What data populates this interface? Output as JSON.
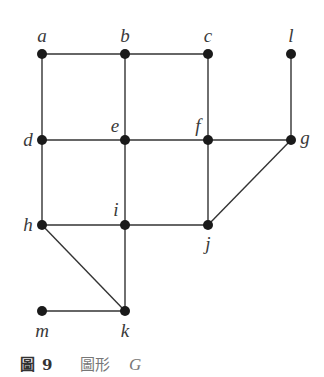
{
  "figure": {
    "caption_prefix": "圖",
    "caption_number": "9",
    "caption_title": "圖形",
    "caption_symbol": "G"
  },
  "graph": {
    "name": "G",
    "nodes": [
      {
        "id": "a",
        "label": "a",
        "x": 42,
        "y": 54,
        "lx": 42,
        "ly": 42,
        "anchor": "middle"
      },
      {
        "id": "b",
        "label": "b",
        "x": 125,
        "y": 54,
        "lx": 125,
        "ly": 42,
        "anchor": "middle"
      },
      {
        "id": "c",
        "label": "c",
        "x": 208,
        "y": 54,
        "lx": 208,
        "ly": 42,
        "anchor": "middle"
      },
      {
        "id": "l",
        "label": "l",
        "x": 291,
        "y": 54,
        "lx": 291,
        "ly": 42,
        "anchor": "middle"
      },
      {
        "id": "d",
        "label": "d",
        "x": 42,
        "y": 140,
        "lx": 28,
        "ly": 146,
        "anchor": "middle"
      },
      {
        "id": "e",
        "label": "e",
        "x": 125,
        "y": 140,
        "lx": 115,
        "ly": 132,
        "anchor": "middle"
      },
      {
        "id": "f",
        "label": "f",
        "x": 208,
        "y": 140,
        "lx": 198,
        "ly": 132,
        "anchor": "middle"
      },
      {
        "id": "g",
        "label": "g",
        "x": 291,
        "y": 140,
        "lx": 305,
        "ly": 144,
        "anchor": "middle"
      },
      {
        "id": "h",
        "label": "h",
        "x": 42,
        "y": 225,
        "lx": 28,
        "ly": 231,
        "anchor": "middle"
      },
      {
        "id": "i",
        "label": "i",
        "x": 125,
        "y": 225,
        "lx": 116,
        "ly": 216,
        "anchor": "middle"
      },
      {
        "id": "j",
        "label": "j",
        "x": 208,
        "y": 225,
        "lx": 208,
        "ly": 250,
        "anchor": "middle"
      },
      {
        "id": "m",
        "label": "m",
        "x": 42,
        "y": 311,
        "lx": 42,
        "ly": 337,
        "anchor": "middle"
      },
      {
        "id": "k",
        "label": "k",
        "x": 125,
        "y": 311,
        "lx": 125,
        "ly": 337,
        "anchor": "middle"
      }
    ],
    "edges": [
      [
        "a",
        "b"
      ],
      [
        "b",
        "c"
      ],
      [
        "a",
        "d"
      ],
      [
        "b",
        "e"
      ],
      [
        "c",
        "f"
      ],
      [
        "l",
        "g"
      ],
      [
        "d",
        "e"
      ],
      [
        "e",
        "f"
      ],
      [
        "f",
        "g"
      ],
      [
        "d",
        "h"
      ],
      [
        "e",
        "i"
      ],
      [
        "f",
        "j"
      ],
      [
        "g",
        "j"
      ],
      [
        "h",
        "i"
      ],
      [
        "i",
        "j"
      ],
      [
        "h",
        "k"
      ],
      [
        "i",
        "k"
      ],
      [
        "m",
        "k"
      ]
    ],
    "colors": {
      "edge": "#333333",
      "node": "#1a1a1a"
    }
  }
}
